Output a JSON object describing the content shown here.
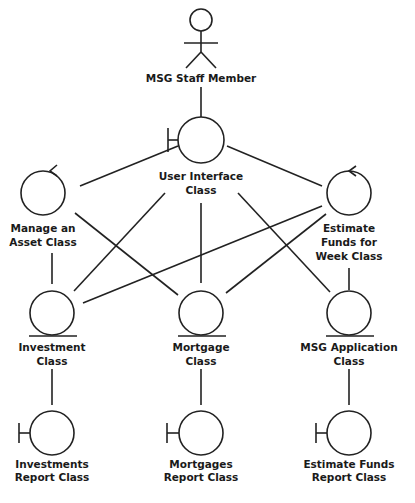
{
  "diagram": {
    "type": "UML robustness / collaboration diagram",
    "colors": {
      "line": "#222222",
      "text": "#1a1a1a",
      "background": "#ffffff"
    },
    "actor": {
      "id": "staff",
      "label": "MSG Staff Member",
      "kind": "actor"
    },
    "nodes": [
      {
        "id": "ui",
        "kind": "boundary",
        "lines": [
          "User Interface",
          "Class"
        ]
      },
      {
        "id": "manage",
        "kind": "control",
        "lines": [
          "Manage an",
          "Asset Class"
        ]
      },
      {
        "id": "estimate",
        "kind": "control",
        "lines": [
          "Estimate",
          "Funds for",
          "Week Class"
        ]
      },
      {
        "id": "investment",
        "kind": "entity",
        "lines": [
          "Investment",
          "Class"
        ]
      },
      {
        "id": "mortgage",
        "kind": "entity",
        "lines": [
          "Mortgage",
          "Class"
        ]
      },
      {
        "id": "msgapp",
        "kind": "entity",
        "lines": [
          "MSG Application",
          "Class"
        ]
      },
      {
        "id": "invreport",
        "kind": "boundary",
        "lines": [
          "Investments",
          "Report Class"
        ]
      },
      {
        "id": "mortreport",
        "kind": "boundary",
        "lines": [
          "Mortgages",
          "Report Class"
        ]
      },
      {
        "id": "estreport",
        "kind": "boundary",
        "lines": [
          "Estimate Funds",
          "Report Class"
        ]
      }
    ],
    "edges": [
      [
        "staff",
        "ui"
      ],
      [
        "ui",
        "manage"
      ],
      [
        "ui",
        "estimate"
      ],
      [
        "ui",
        "investment"
      ],
      [
        "ui",
        "mortgage"
      ],
      [
        "ui",
        "msgapp"
      ],
      [
        "manage",
        "investment"
      ],
      [
        "manage",
        "mortgage"
      ],
      [
        "estimate",
        "investment"
      ],
      [
        "estimate",
        "mortgage"
      ],
      [
        "estimate",
        "msgapp"
      ],
      [
        "investment",
        "invreport"
      ],
      [
        "mortgage",
        "mortreport"
      ],
      [
        "msgapp",
        "estreport"
      ]
    ]
  }
}
